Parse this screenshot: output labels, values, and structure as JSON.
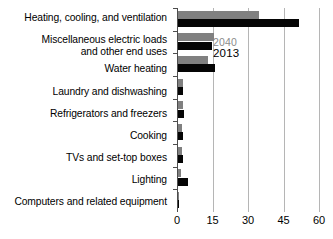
{
  "chart_data": {
    "type": "bar",
    "orientation": "horizontal",
    "title": "",
    "xlabel": "",
    "ylabel": "",
    "xlim": [
      0,
      60
    ],
    "xticks": [
      0,
      15,
      30,
      45,
      60
    ],
    "xticklabels": [
      "0",
      "15",
      "30",
      "45",
      "60"
    ],
    "grid": "vertical",
    "legend_position": "inside-upper-left",
    "categories": [
      "Heating, cooling, and ventilation",
      "Miscellaneous electric loads\nand other end uses",
      "Water heating",
      "Laundry and dishwashing",
      "Refrigerators and freezers",
      "Cooking",
      "TVs and set-top boxes",
      "Lighting",
      "Computers and related equipment"
    ],
    "series": [
      {
        "name": "2040",
        "color": "#808080",
        "values": [
          34.2,
          15.2,
          12.6,
          2.1,
          2.1,
          1.7,
          1.7,
          1.3,
          0.5
        ]
      },
      {
        "name": "2013",
        "color": "#050505",
        "values": [
          51.1,
          14.4,
          15.6,
          2.1,
          2.5,
          2.3,
          2.1,
          4.2,
          0.6
        ]
      }
    ]
  },
  "legend": {
    "entries": [
      {
        "label": "2040",
        "color": "#808080"
      },
      {
        "label": "2013",
        "color": "#050505"
      }
    ]
  }
}
